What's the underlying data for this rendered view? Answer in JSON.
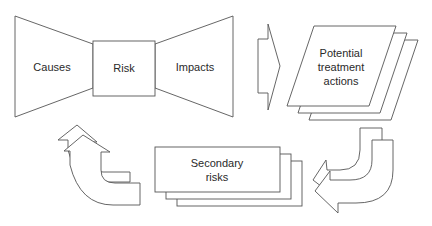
{
  "diagram": {
    "bowtie": {
      "causes": "Causes",
      "risk": "Risk",
      "impacts": "Impacts"
    },
    "treatment": {
      "line1": "Potential",
      "line2": "treatment",
      "line3": "actions"
    },
    "secondary": {
      "line1": "Secondary",
      "line2": "risks"
    },
    "colors": {
      "stroke": "#555555",
      "fill": "#ffffff",
      "text": "#2a2a2a"
    }
  }
}
